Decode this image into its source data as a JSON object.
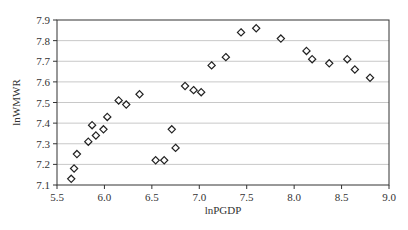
{
  "chart_data": {
    "type": "scatter",
    "title": "",
    "xlabel": "lnPGDP",
    "ylabel": "lnWMWR",
    "xlim": [
      5.5,
      9.0
    ],
    "ylim": [
      7.1,
      7.9
    ],
    "xticks": [
      "5.5",
      "6.0",
      "6.5",
      "7.0",
      "7.5",
      "8.0",
      "8.5",
      "9.0"
    ],
    "yticks": [
      "7.1",
      "7.2",
      "7.3",
      "7.4",
      "7.5",
      "7.6",
      "7.7",
      "7.8",
      "7.9"
    ],
    "grid": "horizontal",
    "legend": null,
    "marker": "hollow-diamond",
    "colors": {
      "marker": "#222222",
      "grid": "#c8c8c8",
      "axis": "#333333"
    },
    "points": [
      {
        "x": 5.65,
        "y": 7.13
      },
      {
        "x": 5.68,
        "y": 7.18
      },
      {
        "x": 5.71,
        "y": 7.25
      },
      {
        "x": 5.83,
        "y": 7.31
      },
      {
        "x": 5.87,
        "y": 7.39
      },
      {
        "x": 5.91,
        "y": 7.34
      },
      {
        "x": 5.99,
        "y": 7.37
      },
      {
        "x": 6.03,
        "y": 7.43
      },
      {
        "x": 6.15,
        "y": 7.51
      },
      {
        "x": 6.23,
        "y": 7.49
      },
      {
        "x": 6.37,
        "y": 7.54
      },
      {
        "x": 6.54,
        "y": 7.22
      },
      {
        "x": 6.63,
        "y": 7.22
      },
      {
        "x": 6.71,
        "y": 7.37
      },
      {
        "x": 6.75,
        "y": 7.28
      },
      {
        "x": 6.85,
        "y": 7.58
      },
      {
        "x": 6.94,
        "y": 7.56
      },
      {
        "x": 7.02,
        "y": 7.55
      },
      {
        "x": 7.13,
        "y": 7.68
      },
      {
        "x": 7.28,
        "y": 7.72
      },
      {
        "x": 7.44,
        "y": 7.84
      },
      {
        "x": 7.6,
        "y": 7.86
      },
      {
        "x": 7.86,
        "y": 7.81
      },
      {
        "x": 8.13,
        "y": 7.75
      },
      {
        "x": 8.19,
        "y": 7.71
      },
      {
        "x": 8.37,
        "y": 7.69
      },
      {
        "x": 8.56,
        "y": 7.71
      },
      {
        "x": 8.64,
        "y": 7.66
      },
      {
        "x": 8.8,
        "y": 7.62
      }
    ]
  }
}
